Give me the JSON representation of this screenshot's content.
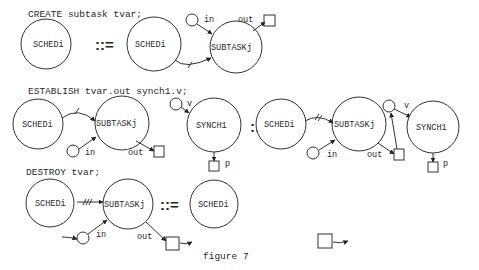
{
  "figure": {
    "caption": "figure 7",
    "rules": [
      {
        "statement": "CREATE subtask tvar;",
        "operator": "::=",
        "lhs": {
          "nodes": [
            "SCHEDi"
          ]
        },
        "rhs": {
          "nodes": [
            "SCHEDi",
            "SUBTASKj"
          ],
          "ports": {
            "in": "in",
            "out": "out"
          },
          "edge_marks": "/"
        }
      },
      {
        "statement": "ESTABLISH tvar.out synch1.v;",
        "operator": "::=",
        "lhs": {
          "nodes": [
            "SCHEDi",
            "SUBTASKj",
            "SYNCH1"
          ],
          "ports": {
            "in": "in",
            "out": "out",
            "v": "v",
            "p": "p"
          },
          "edge_marks": "/"
        },
        "rhs": {
          "nodes": [
            "SCHEDi",
            "SUBTASKj",
            "SYNCH1"
          ],
          "ports": {
            "in": "in",
            "out": "out",
            "v": "v",
            "p": "p"
          },
          "edge_marks": "//"
        }
      },
      {
        "statement": "DESTROY tvar;",
        "operator": "::=",
        "lhs": {
          "nodes": [
            "SCHEDi",
            "SUBTASKj"
          ],
          "ports": {
            "in": "in",
            "out": "out"
          },
          "edge_marks": "///"
        },
        "rhs": {
          "nodes": [
            "SCHEDi"
          ]
        }
      }
    ]
  }
}
